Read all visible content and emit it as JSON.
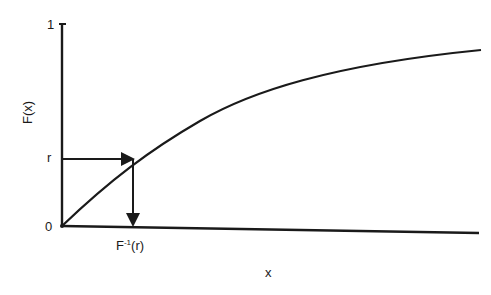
{
  "diagram": {
    "type": "inverse-transform-sampling",
    "y_axis": {
      "label": "F(x)",
      "ticks": [
        {
          "label": "1",
          "value": 1
        },
        {
          "label": "r",
          "value": "r"
        },
        {
          "label": "0",
          "value": 0
        }
      ]
    },
    "x_axis": {
      "label": "x",
      "tick_label_base": "F",
      "tick_label_sup": "-1",
      "tick_label_suffix": "(r)"
    },
    "curve": {
      "name": "CDF F(x)",
      "description": "monotonically increasing concave curve from origin approaching 1"
    },
    "arrows": [
      {
        "name": "horizontal-arrow",
        "from": "r on y-axis",
        "to": "curve"
      },
      {
        "name": "vertical-arrow",
        "from": "curve",
        "to": "F^-1(r) on x-axis"
      }
    ],
    "colors": {
      "stroke": "#1a1a1a",
      "background": "#ffffff"
    }
  }
}
